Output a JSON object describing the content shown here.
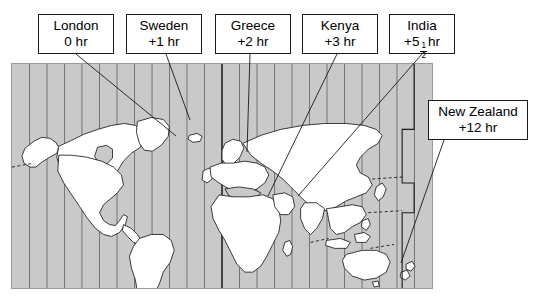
{
  "figure": {
    "type": "world-time-zone-map",
    "map": {
      "ocean_color": "#c9c9c9",
      "land_color": "#ffffff",
      "outline_color": "#1a1a1a",
      "zone_line_color": "#6b6b6b",
      "zone_band_count": 24
    }
  },
  "callouts": [
    {
      "id": "london",
      "place": "London",
      "offset": "0 hr",
      "box": {
        "x": 38,
        "y": 14,
        "w": 76,
        "h": 40
      },
      "leader": {
        "x1": 76,
        "y1": 54,
        "x2": 176,
        "y2": 136
      }
    },
    {
      "id": "sweden",
      "place": "Sweden",
      "offset": "+1 hr",
      "box": {
        "x": 126,
        "y": 14,
        "w": 76,
        "h": 40
      },
      "leader": {
        "x1": 166,
        "y1": 54,
        "x2": 190,
        "y2": 120
      }
    },
    {
      "id": "greece",
      "place": "Greece",
      "offset": "+2 hr",
      "box": {
        "x": 215,
        "y": 14,
        "w": 76,
        "h": 40
      },
      "leader": {
        "x1": 250,
        "y1": 54,
        "x2": 247,
        "y2": 152
      }
    },
    {
      "id": "kenya",
      "place": "Kenya",
      "offset": "+3 hr",
      "box": {
        "x": 302,
        "y": 14,
        "w": 76,
        "h": 40
      },
      "leader": {
        "x1": 337,
        "y1": 54,
        "x2": 268,
        "y2": 196
      }
    },
    {
      "id": "india",
      "place": "India",
      "offset_prefix": "+5",
      "offset_numerator": "1",
      "offset_denominator": "2",
      "offset_suffix": "hr",
      "offset_plain": "+5 1/2 hr",
      "box": {
        "x": 389,
        "y": 14,
        "w": 66,
        "h": 40
      },
      "leader": {
        "x1": 422,
        "y1": 54,
        "x2": 298,
        "y2": 196
      }
    },
    {
      "id": "new-zealand",
      "place": "New Zealand",
      "offset": "+12 hr",
      "box": {
        "x": 428,
        "y": 100,
        "w": 100,
        "h": 40
      },
      "leader": {
        "x1": 444,
        "y1": 140,
        "x2": 401,
        "y2": 263
      }
    }
  ]
}
